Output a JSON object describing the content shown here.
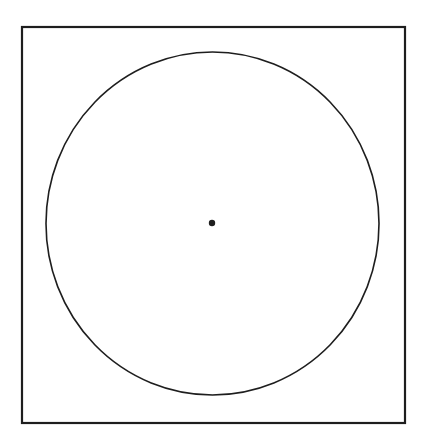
{
  "diagram": {
    "type": "geometry",
    "canvas": {
      "width": 425,
      "height": 444,
      "background": "#ffffff"
    },
    "stroke_color": "#1e1e1e",
    "square": {
      "x": 22,
      "y": 27,
      "width": 383,
      "height": 396,
      "stroke_width": 2.2
    },
    "circle": {
      "cx": 212.5,
      "cy": 223.5,
      "rx": 166.5,
      "ry": 171.5,
      "stroke_width": 1.6
    },
    "center_point": {
      "cx": 212,
      "cy": 223,
      "r": 3.2
    }
  }
}
